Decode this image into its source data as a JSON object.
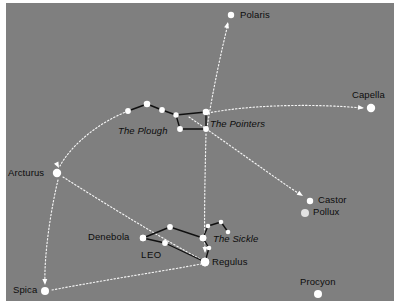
{
  "figure": {
    "kind": "star-chart",
    "background_color": "#7f7f7f",
    "star_color": "#ffffff",
    "asterism_line_color": "#101010",
    "guide_line_color": "#ffffff",
    "label_color": "#0d0d0d",
    "canvas": {
      "width": 400,
      "height": 307
    },
    "sky": {
      "x": 6,
      "y": 3,
      "width": 388,
      "height": 298
    }
  },
  "labels": {
    "polaris": "Polaris",
    "capella": "Capella",
    "the_plough": "The Plough",
    "the_pointers": "The Pointers",
    "arcturus": "Arcturus",
    "castor": "Castor",
    "pollux": "Pollux",
    "denebola": "Denebola",
    "the_sickle": "The Sickle",
    "leo": "LEO",
    "regulus": "Regulus",
    "spica": "Spica",
    "procyon": "Procyon"
  },
  "chart_data": {
    "type": "scatter",
    "title": "",
    "xlabel": "",
    "ylabel": "",
    "named_stars": [
      {
        "name": "Polaris",
        "x": 231,
        "y": 15,
        "r": 3.2,
        "tone": "bright"
      },
      {
        "name": "Capella",
        "x": 371,
        "y": 108,
        "r": 4.2,
        "tone": "bright"
      },
      {
        "name": "Arcturus",
        "x": 57,
        "y": 173,
        "r": 4.2,
        "tone": "bright"
      },
      {
        "name": "Castor",
        "x": 310,
        "y": 201,
        "r": 3.2,
        "tone": "bright"
      },
      {
        "name": "Pollux",
        "x": 305,
        "y": 213,
        "r": 4.0,
        "tone": "dim"
      },
      {
        "name": "Regulus",
        "x": 205,
        "y": 262,
        "r": 4.2,
        "tone": "bright"
      },
      {
        "name": "Denebola",
        "x": 143,
        "y": 238,
        "r": 3.2,
        "tone": "bright"
      },
      {
        "name": "Spica",
        "x": 45,
        "y": 291,
        "r": 4.0,
        "tone": "bright"
      },
      {
        "name": "Procyon",
        "x": 318,
        "y": 294,
        "r": 4.0,
        "tone": "bright"
      }
    ],
    "asterisms": [
      {
        "name": "The Plough",
        "stars": [
          {
            "id": "alkaid",
            "x": 128,
            "y": 111,
            "r": 2.9
          },
          {
            "id": "mizar",
            "x": 147,
            "y": 104,
            "r": 3.3
          },
          {
            "id": "alioth",
            "x": 162,
            "y": 110,
            "r": 2.9
          },
          {
            "id": "megrez",
            "x": 176,
            "y": 115,
            "r": 2.7
          },
          {
            "id": "phecda",
            "x": 180,
            "y": 129,
            "r": 2.9
          },
          {
            "id": "merak",
            "x": 206,
            "y": 129,
            "r": 2.9
          },
          {
            "id": "dubhe",
            "x": 206,
            "y": 112,
            "r": 3.3
          }
        ],
        "segments": [
          [
            "alkaid",
            "mizar"
          ],
          [
            "mizar",
            "alioth"
          ],
          [
            "alioth",
            "megrez"
          ],
          [
            "megrez",
            "phecda"
          ],
          [
            "megrez",
            "dubhe"
          ],
          [
            "phecda",
            "merak"
          ],
          [
            "merak",
            "dubhe"
          ]
        ]
      },
      {
        "name": "The Sickle",
        "stars": [
          {
            "id": "regulus",
            "x": 205,
            "y": 262,
            "r": 4.2
          },
          {
            "id": "eta-leo",
            "x": 209,
            "y": 248,
            "r": 2.3
          },
          {
            "id": "algieba",
            "x": 203,
            "y": 238,
            "r": 3.3
          },
          {
            "id": "zeta-leo",
            "x": 208,
            "y": 226,
            "r": 2.3
          },
          {
            "id": "mu-leo",
            "x": 221,
            "y": 222,
            "r": 2.3
          },
          {
            "id": "epsilon",
            "x": 228,
            "y": 232,
            "r": 2.3
          }
        ],
        "segments": [
          [
            "regulus",
            "eta-leo"
          ],
          [
            "eta-leo",
            "algieba"
          ],
          [
            "algieba",
            "zeta-leo"
          ],
          [
            "zeta-leo",
            "mu-leo"
          ],
          [
            "mu-leo",
            "epsilon"
          ]
        ]
      },
      {
        "name": "Leo body",
        "stars": [
          {
            "id": "denebola2",
            "x": 143,
            "y": 238,
            "r": 3.2
          },
          {
            "id": "zosma",
            "x": 170,
            "y": 227,
            "r": 2.9
          },
          {
            "id": "chort",
            "x": 165,
            "y": 243,
            "r": 2.9
          },
          {
            "id": "algieba2",
            "x": 203,
            "y": 238,
            "r": 3.3
          },
          {
            "id": "regulus2",
            "x": 205,
            "y": 262,
            "r": 4.2
          }
        ],
        "segments": [
          [
            "denebola2",
            "zosma"
          ],
          [
            "denebola2",
            "chort"
          ],
          [
            "zosma",
            "algieba2"
          ],
          [
            "chort",
            "regulus2"
          ]
        ]
      }
    ],
    "guide_arrows": [
      {
        "name": "pointers-to-polaris",
        "path": "M 207,128 C 212,95 221,52 228,24",
        "arrow_at": {
          "x": 228,
          "y": 22,
          "angle": -76
        }
      },
      {
        "name": "pointers-to-capella",
        "path": "M 208,113 C 255,104 320,104 362,108",
        "arrow_at": {
          "x": 364,
          "y": 108,
          "angle": 6
        }
      },
      {
        "name": "plough-handle-to-arcturus",
        "path": "M 131,110 C 100,121 71,145 60,166",
        "arrow_at": {
          "x": 59,
          "y": 168,
          "angle": 62
        }
      },
      {
        "name": "arcturus-to-spica",
        "path": "M 58,180 C 50,213 44,258 45,283",
        "arrow_at": {
          "x": 45,
          "y": 285,
          "angle": 88
        }
      },
      {
        "name": "spica-to-regulus-to-arcturus",
        "path": "M 52,290 C 110,279 170,270 201,264",
        "arrow_at": null
      },
      {
        "name": "arcturus-to-regulus",
        "path": "M 63,177 C 110,207 170,243 200,259",
        "arrow_at": null
      },
      {
        "name": "plough-bowl-to-regulus",
        "path": "M 206,134 C 205,175 204,220 205,251",
        "arrow_at": {
          "x": 205,
          "y": 253,
          "angle": 90
        }
      },
      {
        "name": "plough-to-castor-pollux",
        "path": "M 189,117 C 230,145 275,178 301,195",
        "arrow_at": {
          "x": 303,
          "y": 196,
          "angle": 33
        }
      }
    ],
    "text_annotations": [
      {
        "text": "Polaris",
        "x": 240,
        "y": 10,
        "style": "plain"
      },
      {
        "text": "Capella",
        "x": 352,
        "y": 90,
        "style": "plain"
      },
      {
        "text": "The Plough",
        "x": 118,
        "y": 126,
        "style": "italic"
      },
      {
        "text": "The Pointers",
        "x": 210,
        "y": 119,
        "style": "italic"
      },
      {
        "text": "Arcturus",
        "x": 8,
        "y": 168,
        "style": "plain"
      },
      {
        "text": "Castor",
        "x": 318,
        "y": 195,
        "style": "plain"
      },
      {
        "text": "Pollux",
        "x": 313,
        "y": 207,
        "style": "plain"
      },
      {
        "text": "Denebola",
        "x": 88,
        "y": 232,
        "style": "plain"
      },
      {
        "text": "The Sickle",
        "x": 213,
        "y": 234,
        "style": "italic"
      },
      {
        "text": "LEO",
        "x": 141,
        "y": 250,
        "style": "caps"
      },
      {
        "text": "Regulus",
        "x": 212,
        "y": 257,
        "style": "plain"
      },
      {
        "text": "Spica",
        "x": 13,
        "y": 285,
        "style": "plain"
      },
      {
        "text": "Procyon",
        "x": 300,
        "y": 277,
        "style": "plain"
      }
    ]
  }
}
